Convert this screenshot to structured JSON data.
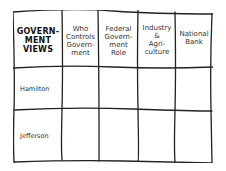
{
  "table": {
    "title": "GOVERN-\nMENT\nVIEWS",
    "title_lines": [
      "GOVERN-",
      "MENT",
      "VIEWS"
    ],
    "columns": [
      {
        "lines": [
          "Who",
          "Controls",
          "Govern-",
          "ment"
        ]
      },
      {
        "lines": [
          "Federal",
          "Govern-",
          "ment",
          "Role"
        ]
      },
      {
        "lines": [
          "Industry",
          "&",
          "Agri-",
          "culture"
        ]
      },
      {
        "lines": [
          "National",
          "Bank"
        ]
      }
    ],
    "rows": [
      {
        "label": "Hamilton",
        "cells": [
          "",
          "",
          "",
          ""
        ]
      },
      {
        "label": "Jefferson",
        "cells": [
          "",
          "",
          "",
          ""
        ]
      }
    ]
  }
}
